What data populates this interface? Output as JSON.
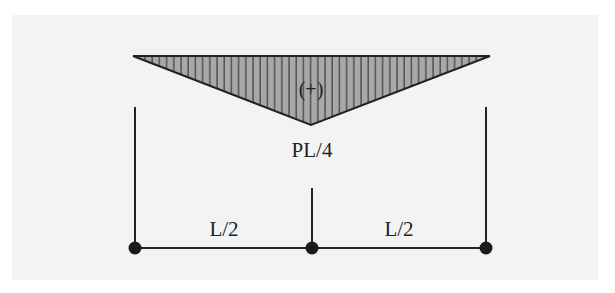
{
  "diagram": {
    "type": "bending-moment-diagram",
    "colors": {
      "background": "#ffffff",
      "panel": "#f3f3f3",
      "line": "#222222",
      "fill": "#a8a8a8",
      "hatch": "#333333"
    },
    "labels": {
      "sign": "(+)",
      "peak_value": "PL/4",
      "left_span": "L/2",
      "right_span": "L/2"
    },
    "nodes": [
      {
        "name": "left-support",
        "x": 135,
        "y": 248
      },
      {
        "name": "mid-point",
        "x": 312,
        "y": 248
      },
      {
        "name": "right-support",
        "x": 486,
        "y": 248
      }
    ]
  }
}
